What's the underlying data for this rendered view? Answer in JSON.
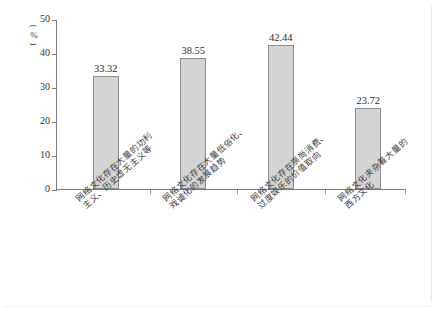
{
  "axis": {
    "unit_label": "（%）",
    "unit_open_paren": "(",
    "unit_symbol": "%",
    "unit_close_paren": ")",
    "y_ticks": [
      "0",
      "10",
      "20",
      "30",
      "40",
      "50"
    ]
  },
  "chart_data": {
    "type": "bar",
    "title": "",
    "xlabel": "",
    "ylabel": "（%）",
    "ylim": [
      0,
      50
    ],
    "grid": false,
    "legend": "none",
    "categories": [
      "网络文化存在大量的功利主义、历史虚无主义等",
      "网络文化存在大量低俗化、戏谑化的发展趋势",
      "网络文化存在崇尚消费、过度娱乐的价值取向",
      "网络文化夹杂着大量的西方文化"
    ],
    "category_lines": [
      [
        "网络文化存在大量的功利",
        "主义、历史虚无主义等"
      ],
      [
        "网络文化存在大量低俗化、",
        "戏谑化的发展趋势"
      ],
      [
        "网络文化存在崇尚消费、",
        "过度娱乐的价值取向"
      ],
      [
        "网络文化夹杂着大量的",
        "西方文化"
      ]
    ],
    "values": [
      33.32,
      38.55,
      42.44,
      23.72
    ],
    "value_labels": [
      "33.32",
      "38.55",
      "42.44",
      "23.72"
    ],
    "bar_fill": "#d4d4d4",
    "bar_stroke": "#8d8d8d",
    "axis_color": "#7c7c7c"
  }
}
